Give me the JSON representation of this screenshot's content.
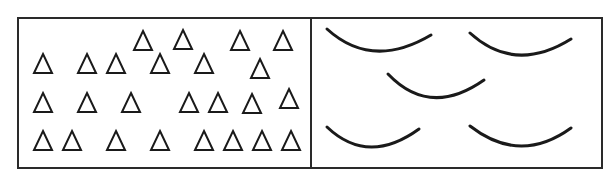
{
  "figure": {
    "colors": {
      "background": "#ffffff",
      "stroke": "#1a1a1a",
      "frame": "#2a2a2a"
    },
    "frame": {
      "x": 18,
      "y": 18,
      "width": 584,
      "height": 150,
      "divider_x": 311
    },
    "left_panel": {
      "shape": "triangle-outline",
      "count": 25,
      "size": 20,
      "triangles": [
        {
          "x": 133,
          "y": 30
        },
        {
          "x": 173,
          "y": 29
        },
        {
          "x": 230,
          "y": 30
        },
        {
          "x": 273,
          "y": 30
        },
        {
          "x": 33,
          "y": 53
        },
        {
          "x": 77,
          "y": 53
        },
        {
          "x": 106,
          "y": 53
        },
        {
          "x": 150,
          "y": 53
        },
        {
          "x": 194,
          "y": 53
        },
        {
          "x": 250,
          "y": 58
        },
        {
          "x": 33,
          "y": 92
        },
        {
          "x": 77,
          "y": 92
        },
        {
          "x": 121,
          "y": 92
        },
        {
          "x": 179,
          "y": 92
        },
        {
          "x": 208,
          "y": 92
        },
        {
          "x": 242,
          "y": 93
        },
        {
          "x": 279,
          "y": 88
        },
        {
          "x": 33,
          "y": 130
        },
        {
          "x": 62,
          "y": 130
        },
        {
          "x": 106,
          "y": 130
        },
        {
          "x": 150,
          "y": 130
        },
        {
          "x": 194,
          "y": 130
        },
        {
          "x": 223,
          "y": 130
        },
        {
          "x": 252,
          "y": 130
        },
        {
          "x": 281,
          "y": 130
        }
      ]
    },
    "right_panel": {
      "shape": "arc",
      "count": 5,
      "arcs": [
        {
          "x1": 327,
          "y1": 29,
          "cx": 372,
          "cy": 70,
          "x2": 431,
          "y2": 35
        },
        {
          "x1": 470,
          "y1": 33,
          "cx": 515,
          "cy": 74,
          "x2": 571,
          "y2": 39
        },
        {
          "x1": 388,
          "y1": 74,
          "cx": 430,
          "cy": 118,
          "x2": 484,
          "y2": 80
        },
        {
          "x1": 327,
          "y1": 127,
          "cx": 368,
          "cy": 166,
          "x2": 419,
          "y2": 129
        },
        {
          "x1": 470,
          "y1": 126,
          "cx": 520,
          "cy": 165,
          "x2": 571,
          "y2": 128
        }
      ]
    }
  }
}
